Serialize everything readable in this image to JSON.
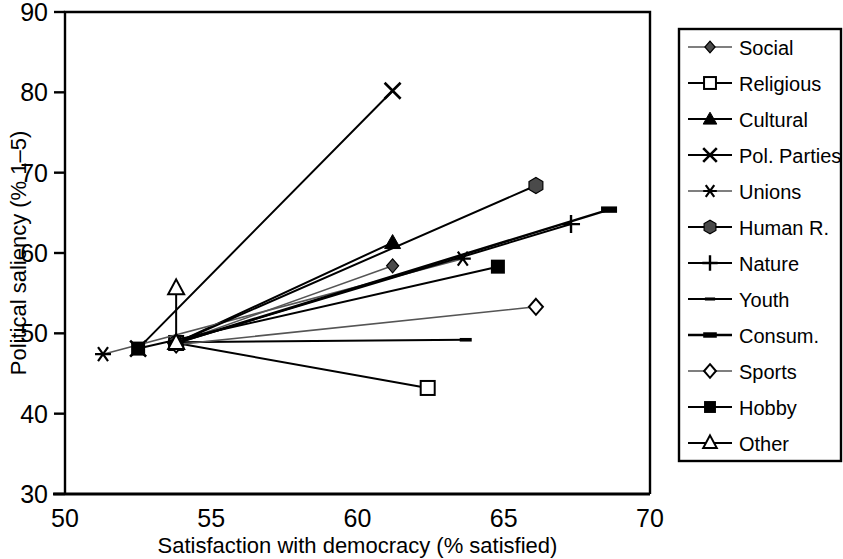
{
  "chart_data": {
    "type": "line",
    "title": "",
    "xlabel": "Satisfaction with democracy (% satisfied)",
    "ylabel": "Political saliency (% 1–5)",
    "xlim": [
      50,
      70
    ],
    "ylim": [
      30,
      90
    ],
    "xticks": [
      50,
      55,
      60,
      65,
      70
    ],
    "yticks": [
      30,
      40,
      50,
      60,
      70,
      80,
      90
    ],
    "grid": false,
    "legend_position": "right-outside",
    "series": [
      {
        "name": "Social",
        "marker": "filled-diamond",
        "x": [
          53.8,
          61.2
        ],
        "y": [
          48.8,
          58.4
        ]
      },
      {
        "name": "Religious",
        "marker": "open-square",
        "x": [
          53.8,
          62.4
        ],
        "y": [
          48.8,
          43.2
        ]
      },
      {
        "name": "Cultural",
        "marker": "filled-triangle",
        "x": [
          53.8,
          61.2
        ],
        "y": [
          48.8,
          61.3
        ]
      },
      {
        "name": "Pol. Parties",
        "marker": "cross-x",
        "x": [
          52.5,
          61.2
        ],
        "y": [
          48.1,
          80.2
        ]
      },
      {
        "name": "Unions",
        "marker": "asterisk",
        "x": [
          51.3,
          63.6
        ],
        "y": [
          47.4,
          59.3
        ]
      },
      {
        "name": "Human R.",
        "marker": "filled-hexagon",
        "x": [
          53.8,
          66.1
        ],
        "y": [
          48.8,
          68.4
        ]
      },
      {
        "name": "Nature",
        "marker": "plus",
        "x": [
          53.8,
          67.3
        ],
        "y": [
          48.8,
          63.6
        ]
      },
      {
        "name": "Youth",
        "marker": "dash",
        "x": [
          53.8,
          63.7
        ],
        "y": [
          48.9,
          49.2
        ]
      },
      {
        "name": "Consum.",
        "marker": "thick-dash",
        "x": [
          53.8,
          68.6
        ],
        "y": [
          48.8,
          65.4
        ]
      },
      {
        "name": "Sports",
        "marker": "open-diamond",
        "x": [
          53.8,
          66.1
        ],
        "y": [
          48.6,
          53.3
        ]
      },
      {
        "name": "Hobby",
        "marker": "filled-square",
        "x": [
          52.5,
          64.8
        ],
        "y": [
          48.1,
          58.3
        ]
      },
      {
        "name": "Other",
        "marker": "open-triangle",
        "x": [
          53.8,
          53.8
        ],
        "y": [
          48.8,
          55.6
        ]
      }
    ]
  },
  "axes": {
    "x_title": "Satisfaction with democracy (% satisfied)",
    "y_title": "Political saliency (% 1–5)",
    "x_tick_labels": [
      "50",
      "55",
      "60",
      "65",
      "70"
    ],
    "y_tick_labels": [
      "30",
      "40",
      "50",
      "60",
      "70",
      "80",
      "90"
    ]
  },
  "legend": {
    "items": [
      {
        "label": "Social",
        "marker": "filled-diamond"
      },
      {
        "label": "Religious",
        "marker": "open-square"
      },
      {
        "label": "Cultural",
        "marker": "filled-triangle"
      },
      {
        "label": "Pol. Parties",
        "marker": "cross-x"
      },
      {
        "label": "Unions",
        "marker": "asterisk"
      },
      {
        "label": "Human R.",
        "marker": "filled-hexagon"
      },
      {
        "label": "Nature",
        "marker": "plus"
      },
      {
        "label": "Youth",
        "marker": "dash"
      },
      {
        "label": "Consum.",
        "marker": "thick-dash"
      },
      {
        "label": "Sports",
        "marker": "open-diamond"
      },
      {
        "label": "Hobby",
        "marker": "filled-square"
      },
      {
        "label": "Other",
        "marker": "open-triangle"
      }
    ]
  },
  "colors": {
    "ink": "#000000",
    "background": "#ffffff",
    "muted_line": "#555555"
  }
}
